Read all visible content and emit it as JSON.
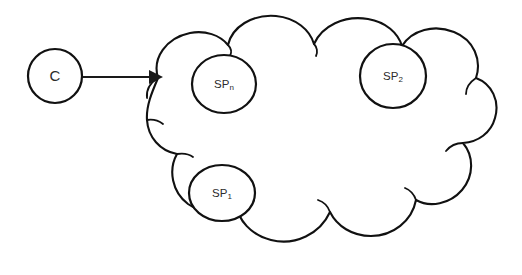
{
  "diagram": {
    "background_color": "#ffffff",
    "ink_color": "#111111",
    "client": {
      "label": "C",
      "name": "client-node"
    },
    "connector": {
      "label": "",
      "direction": "client-to-cloud",
      "arrow_color": "#1a1a1a"
    },
    "cloud": {
      "label": "",
      "name": "cloud-boundary"
    },
    "providers": [
      {
        "base": "SP",
        "subscript": "n",
        "full_label": "SPn",
        "name": "service-provider-n"
      },
      {
        "base": "SP",
        "subscript": "2",
        "full_label": "SP2",
        "name": "service-provider-2"
      },
      {
        "base": "SP",
        "subscript": "1",
        "full_label": "SP1",
        "name": "service-provider-1"
      }
    ]
  }
}
